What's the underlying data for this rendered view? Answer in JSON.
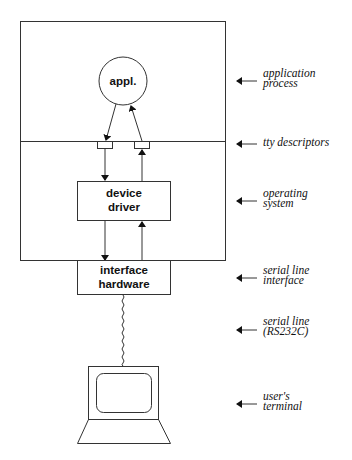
{
  "diagram": {
    "process_circle": {
      "label": "appl."
    },
    "device_driver": {
      "line1": "device",
      "line2": "driver"
    },
    "interface_hardware": {
      "line1": "interface",
      "line2": "hardware"
    },
    "annotations": [
      {
        "line1": "application",
        "line2": "process"
      },
      {
        "line1": "tty descriptors",
        "line2": ""
      },
      {
        "line1": "operating",
        "line2": "system"
      },
      {
        "line1": "serial line",
        "line2": "interface"
      },
      {
        "line1": "serial line",
        "line2": "(RS232C)"
      },
      {
        "line1": "user's",
        "line2": "terminal"
      }
    ]
  }
}
